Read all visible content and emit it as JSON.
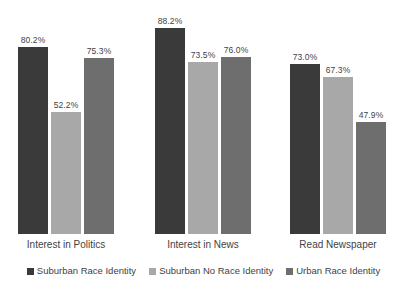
{
  "chart_data": {
    "type": "bar",
    "title": "",
    "subtitle": "",
    "xlabel": "",
    "ylabel": "",
    "ylim": [
      0,
      100
    ],
    "grid": false,
    "legend_position": "bottom",
    "value_suffix": "%",
    "categories": [
      "Interest in Politics",
      "Interest in News",
      "Read Newspaper"
    ],
    "series": [
      {
        "name": "Suburban Race Identity",
        "color": "#3a3a3a",
        "values": [
          80.2,
          52.2,
          73.0
        ],
        "labels": [
          "80.2%",
          "52.2%",
          "73.0%"
        ]
      },
      {
        "name": "Suburban No Race Identity",
        "color": "#a8a8a8",
        "values": [
          52.2,
          73.5,
          67.3
        ],
        "labels": [
          "52.2%",
          "73.5%",
          "67.3%"
        ]
      },
      {
        "name": "Urban Race Identity",
        "color": "#6e6e6e",
        "values": [
          75.3,
          76.0,
          47.9
        ],
        "labels": [
          "75.3%",
          "76.0%",
          "47.9%"
        ]
      }
    ],
    "groups": [
      {
        "category": "Interest in Politics",
        "bars": [
          {
            "series": "Suburban Race Identity",
            "value": 80.2,
            "label": "80.2%",
            "color": "#3a3a3a"
          },
          {
            "series": "Suburban No Race Identity",
            "value": 52.2,
            "label": "52.2%",
            "color": "#a8a8a8"
          },
          {
            "series": "Urban Race Identity",
            "value": 75.3,
            "label": "75.3%",
            "color": "#6e6e6e"
          }
        ]
      },
      {
        "category": "Interest in News",
        "bars": [
          {
            "series": "Suburban Race Identity",
            "value": 88.2,
            "label": "88.2%",
            "color": "#3a3a3a"
          },
          {
            "series": "Suburban No Race Identity",
            "value": 73.5,
            "label": "73.5%",
            "color": "#a8a8a8"
          },
          {
            "series": "Urban Race Identity",
            "value": 76.0,
            "label": "76.0%",
            "color": "#6e6e6e"
          }
        ]
      },
      {
        "category": "Read Newspaper",
        "bars": [
          {
            "series": "Suburban Race Identity",
            "value": 73.0,
            "label": "73.0%",
            "color": "#3a3a3a"
          },
          {
            "series": "Suburban No Race Identity",
            "value": 67.3,
            "label": "67.3%",
            "color": "#a8a8a8"
          },
          {
            "series": "Urban Race Identity",
            "value": 47.9,
            "label": "47.9%",
            "color": "#6e6e6e"
          }
        ]
      }
    ]
  },
  "legend": {
    "items": [
      {
        "label": "Suburban Race Identity",
        "color": "#3a3a3a"
      },
      {
        "label": "Suburban No Race Identity",
        "color": "#a8a8a8"
      },
      {
        "label": "Urban Race Identity",
        "color": "#6e6e6e"
      }
    ]
  },
  "layout": {
    "baseline_y": 234,
    "px_per_percent": 2.335,
    "bar_width": 30,
    "bar_gap": 3,
    "group_left_offsets": [
      18,
      155,
      290
    ]
  }
}
